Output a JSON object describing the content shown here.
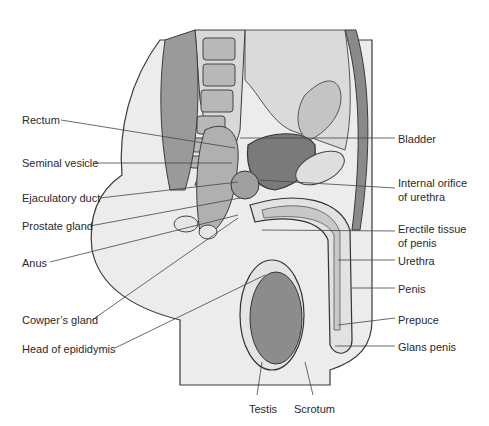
{
  "figure": {
    "colors": {
      "background": "#ffffff",
      "skin_fill": "#ececec",
      "tissue_light": "#dcdcdc",
      "tissue_mid": "#a9a9a9",
      "tissue_dark": "#6e6e6e",
      "outline": "#3a3a3a",
      "leader_line": "#444444",
      "label_text": "#2a2a2a"
    },
    "left_labels": [
      {
        "text": "Rectum",
        "x": 22,
        "y": 114
      },
      {
        "text": "Seminal vesicle",
        "x": 22,
        "y": 157
      },
      {
        "text": "Ejaculatory duct",
        "x": 22,
        "y": 192
      },
      {
        "text": "Prostate gland",
        "x": 22,
        "y": 220
      },
      {
        "text": "Anus",
        "x": 22,
        "y": 257
      },
      {
        "text": "Cowper’s gland",
        "x": 22,
        "y": 314
      },
      {
        "text": "Head of epididymis",
        "x": 22,
        "y": 343
      }
    ],
    "right_labels": [
      {
        "text": "Bladder",
        "x": 398,
        "y": 133
      },
      {
        "text": "Internal orifice",
        "x": 398,
        "y": 177
      },
      {
        "text": "of urethra",
        "x": 398,
        "y": 191
      },
      {
        "text": "Erectile tissue",
        "x": 398,
        "y": 223
      },
      {
        "text": "of penis",
        "x": 398,
        "y": 237
      },
      {
        "text": "Urethra",
        "x": 398,
        "y": 255
      },
      {
        "text": "Penis",
        "x": 398,
        "y": 283
      },
      {
        "text": "Prepuce",
        "x": 398,
        "y": 314
      },
      {
        "text": "Glans penis",
        "x": 398,
        "y": 341
      }
    ],
    "bottom_labels": [
      {
        "text": "Testis",
        "x": 249,
        "y": 403
      },
      {
        "text": "Scrotum",
        "x": 294,
        "y": 403
      }
    ]
  }
}
